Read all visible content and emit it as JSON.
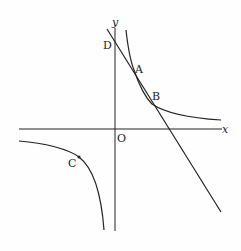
{
  "diagram": {
    "type": "coordinate-plane",
    "axes": {
      "x_label": "x",
      "y_label": "y",
      "origin_label": "O"
    },
    "points": [
      {
        "label": "A"
      },
      {
        "label": "B"
      },
      {
        "label": "C"
      },
      {
        "label": "D"
      }
    ],
    "curves": [
      "hyperbola upper-right branch",
      "hyperbola lower-left branch",
      "line through D, A, B"
    ],
    "stroke_color": "#222222"
  }
}
